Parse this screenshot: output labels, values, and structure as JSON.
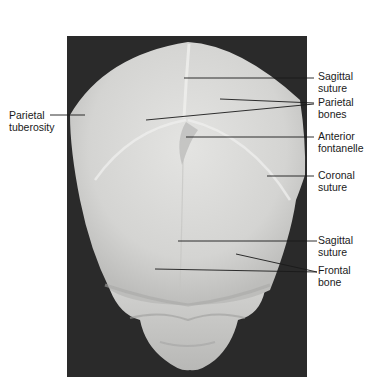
{
  "figure": {
    "colors": {
      "background": "#ffffff",
      "photo_background": "#2a2a2a",
      "bone": "#d8d8d6",
      "leader_line": "#1a1a1a",
      "label_text": "#1a1a1a"
    }
  },
  "labels": [
    {
      "id": "sagittal-suture-upper",
      "text": "Sagittal\nsuture",
      "x": 318,
      "y": 70
    },
    {
      "id": "parietal-bones",
      "text": "Parietal\nbones",
      "x": 318,
      "y": 96
    },
    {
      "id": "anterior-fontanelle",
      "text": "Anterior\nfontanelle",
      "x": 318,
      "y": 130
    },
    {
      "id": "coronal-suture",
      "text": "Coronal\nsuture",
      "x": 318,
      "y": 169
    },
    {
      "id": "sagittal-suture-lower",
      "text": "Sagittal\nsuture",
      "x": 318,
      "y": 234
    },
    {
      "id": "frontal-bone",
      "text": "Frontal\nbone",
      "x": 318,
      "y": 264
    },
    {
      "id": "parietal-tuberosity",
      "text": "Parietal\ntuberosity",
      "x": 9,
      "y": 109
    }
  ]
}
